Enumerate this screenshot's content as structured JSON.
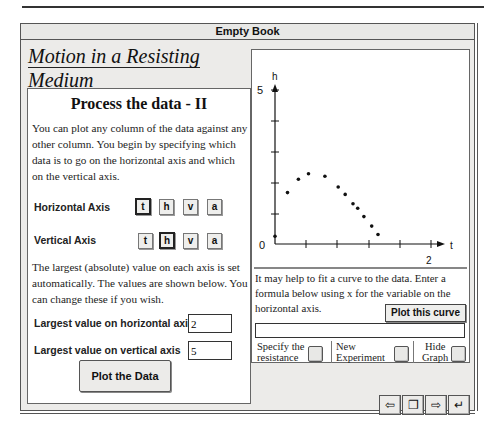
{
  "window": {
    "title": "Empty Book"
  },
  "lesson": {
    "title": "Motion in a Resisting Medium"
  },
  "left_panel": {
    "heading": "Process the data  - II",
    "intro": "You can plot any column of the data against any other column.  You begin by specifying which data is to go on the horizontal axis and which on the vertical axis.",
    "horizontal_axis": {
      "label": "Horizontal Axis",
      "options": [
        "t",
        "h",
        "v",
        "a"
      ],
      "selected": "t"
    },
    "vertical_axis": {
      "label": "Vertical Axis",
      "options": [
        "t",
        "h",
        "v",
        "a"
      ],
      "selected": "h"
    },
    "largest_note": "The largest (absolute) value on each axis is set automatically.  The values are shown below.  You can change these if you wish.",
    "max_horizontal": {
      "label": "Largest value on horizontal axis",
      "value": "2"
    },
    "max_vertical": {
      "label": "Largest value on vertical axis",
      "value": "5"
    },
    "plot_button": "Plot the Data"
  },
  "graph": {
    "x_axis_label": "t",
    "y_axis_label": "h",
    "origin_label": "0",
    "x_max_label": "2",
    "y_max_label": "5"
  },
  "chart_data": {
    "type": "scatter",
    "title": "",
    "xlabel": "t",
    "ylabel": "h",
    "xlim": [
      0,
      2
    ],
    "ylim": [
      0,
      5
    ],
    "x_ticks": [
      0.4,
      0.8,
      1.2,
      1.6,
      2.0
    ],
    "y_ticks": [
      1,
      2,
      3,
      4,
      5
    ],
    "grid": false,
    "series": [
      {
        "name": "h vs t",
        "points": [
          [
            0.0,
            0.25
          ],
          [
            0.16,
            1.67
          ],
          [
            0.3,
            2.1
          ],
          [
            0.43,
            2.28
          ],
          [
            0.64,
            2.2
          ],
          [
            0.81,
            1.85
          ],
          [
            0.9,
            1.61
          ],
          [
            1.0,
            1.31
          ],
          [
            1.06,
            1.16
          ],
          [
            1.14,
            0.89
          ],
          [
            1.24,
            0.58
          ],
          [
            1.32,
            0.31
          ]
        ]
      }
    ]
  },
  "right_panel": {
    "fit_text": "It may help to fit a curve to the data.  Enter a formula below using x for the variable on the horizontal axis.",
    "plot_curve_button": "Plot this curve",
    "formula_value": "",
    "options": [
      {
        "label_line1": "Specify the",
        "label_line2": "resistance"
      },
      {
        "label_line1": "New",
        "label_line2": "Experiment"
      },
      {
        "label_line1": "Hide",
        "label_line2": "Graph"
      }
    ]
  },
  "nav": {
    "buttons": [
      {
        "name": "back",
        "glyph": "⇦"
      },
      {
        "name": "contents",
        "glyph": "❐"
      },
      {
        "name": "next",
        "glyph": "⇨"
      },
      {
        "name": "return",
        "glyph": "↵"
      }
    ]
  }
}
